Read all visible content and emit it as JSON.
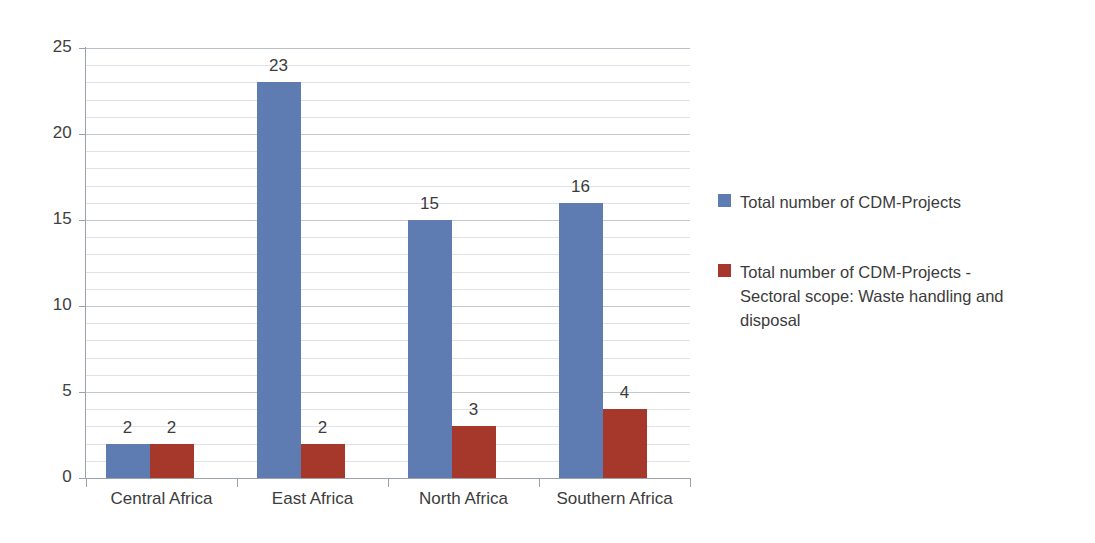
{
  "chart_data": {
    "type": "bar",
    "title": "",
    "subtitle": "",
    "xlabel": "",
    "ylabel": "",
    "categories": [
      "Central Africa",
      "East Africa",
      "North Africa",
      "Southern Africa"
    ],
    "series": [
      {
        "name": "Total number of CDM-Projects",
        "color": "#5f7cb2",
        "values": [
          2,
          23,
          15,
          16
        ]
      },
      {
        "name": "Total number of CDM-Projects - Sectoral scope: Waste handling and disposal",
        "color": "#a5382a",
        "values": [
          2,
          2,
          3,
          4
        ]
      }
    ],
    "ylim": [
      0,
      25
    ],
    "y_ticks": [
      0,
      5,
      10,
      15,
      20,
      25
    ],
    "y_tick_labels": [
      "0",
      "5",
      "10",
      "15",
      "20",
      "25"
    ],
    "minor_tick_step": 1,
    "grid": true,
    "grid_axis": "y",
    "legend_position": "right",
    "data_labels": true,
    "data_label_values": [
      [
        "2",
        "2"
      ],
      [
        "23",
        "2"
      ],
      [
        "15",
        "3"
      ],
      [
        "16",
        "4"
      ]
    ]
  },
  "legend": {
    "entries": [
      {
        "label": "Total number of CDM-Projects",
        "color": "#5f7cb2"
      },
      {
        "label": "Total number of CDM-Projects - Sectoral scope: Waste handling and disposal",
        "color": "#a5382a"
      }
    ]
  },
  "colors": {
    "series_a": "#5f7cb2",
    "series_b": "#a5382a",
    "gridline": "#dfe3e8",
    "gridline_major": "#c3c8ce",
    "axis": "#9aa1a9",
    "text": "#3c3c3c",
    "background": "#ffffff"
  }
}
